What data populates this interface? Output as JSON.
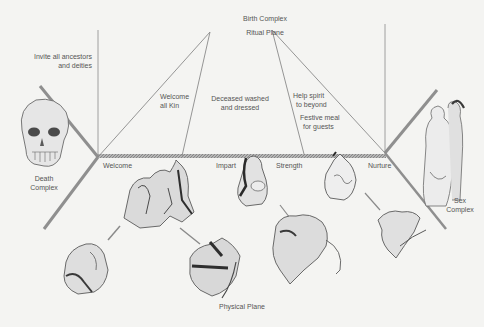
{
  "diagram": {
    "title_top": {
      "line1": "Birth Complex",
      "line2": "Ritual Plane"
    },
    "bottom_label": "Physical Plane",
    "complexes": {
      "death": {
        "line1": "Death",
        "line2": "Complex"
      },
      "sex": {
        "line1": "Sex",
        "line2": "Complex"
      }
    },
    "ritual_notes": {
      "invite": {
        "line1": "Invite all ancestors",
        "line2": "and deities"
      },
      "welcome_kin": {
        "line1": "Welcome",
        "line2": "all Kin"
      },
      "washed": {
        "line1": "Deceased washed",
        "line2": "and dressed"
      },
      "help_spirit": {
        "line1": "Help spirit",
        "line2": "to beyond"
      },
      "festive": {
        "line1": "Festive meal",
        "line2": "for guests"
      }
    },
    "axis_labels": [
      "Welcome",
      "Impart",
      "Strength",
      "Nurture"
    ],
    "illustrations": [
      "skull-illustration",
      "embracing-couple-illustration",
      "birth-scene-illustration",
      "mother-nursing-illustration",
      "womb-infant-illustration",
      "infant-lower-left-illustration",
      "figures-physical-plane-illustration",
      "figures-group-illustration",
      "hands-reaching-illustration"
    ],
    "colors": {
      "background": "#f4f4f2",
      "line": "#8a8a8a",
      "bar": "#9a9a9a",
      "text": "#555555"
    }
  }
}
